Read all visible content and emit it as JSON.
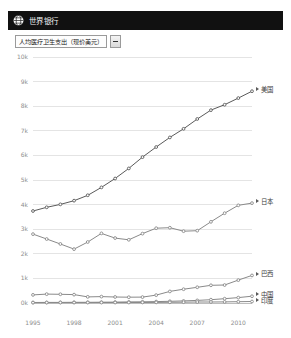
{
  "header": {
    "logo_icon": "globe-icon",
    "title": "世界银行"
  },
  "indicator_select": {
    "value": "人均医疗卫生支出（现价美元）",
    "dropdown_icon": "chevron-down-icon"
  },
  "chart_data": {
    "type": "line",
    "title": "",
    "xlabel": "",
    "ylabel": "",
    "grid": true,
    "legend_position": "right",
    "xlim": [
      1995,
      2011
    ],
    "ylim": [
      0,
      10000
    ],
    "x": [
      1995,
      1996,
      1997,
      1998,
      1999,
      2000,
      2001,
      2002,
      2003,
      2004,
      2005,
      2006,
      2007,
      2008,
      2009,
      2010,
      2011
    ],
    "xtick_labels": [
      "1995",
      "1998",
      "2001",
      "2004",
      "2007",
      "2010"
    ],
    "xtick_values": [
      1995,
      1998,
      2001,
      2004,
      2007,
      2010
    ],
    "ytick_labels": [
      "0k",
      "1k",
      "2k",
      "3k",
      "4k",
      "5k",
      "6k",
      "7k",
      "8k",
      "9k",
      "10k"
    ],
    "ytick_values": [
      0,
      1000,
      2000,
      3000,
      4000,
      5000,
      6000,
      7000,
      8000,
      9000,
      10000
    ],
    "series": [
      {
        "name": "美国",
        "color": "#5a5a5a",
        "values": [
          3740,
          3890,
          4010,
          4160,
          4380,
          4700,
          5060,
          5470,
          5930,
          6340,
          6730,
          7080,
          7480,
          7840,
          8060,
          8330,
          8610
        ]
      },
      {
        "name": "日本",
        "color": "#8a8a8a",
        "values": [
          2800,
          2600,
          2400,
          2190,
          2480,
          2830,
          2640,
          2570,
          2820,
          3040,
          3060,
          2920,
          2940,
          3300,
          3650,
          3970,
          4060
        ]
      },
      {
        "name": "巴西",
        "color": "#8a8a8a",
        "values": [
          330,
          360,
          355,
          340,
          250,
          260,
          245,
          235,
          240,
          320,
          470,
          560,
          640,
          720,
          730,
          930,
          1120
        ]
      },
      {
        "name": "中国",
        "color": "#8a8a8a",
        "values": [
          20,
          23,
          26,
          28,
          30,
          33,
          37,
          44,
          50,
          58,
          70,
          84,
          105,
          135,
          175,
          220,
          275
        ]
      },
      {
        "name": "印度",
        "color": "#8a8a8a",
        "values": [
          15,
          16,
          17,
          17,
          18,
          19,
          19,
          20,
          22,
          25,
          29,
          33,
          40,
          42,
          44,
          52,
          60
        ]
      }
    ]
  },
  "legend": [
    {
      "label": "美国"
    },
    {
      "label": "日本"
    },
    {
      "label": "巴西"
    },
    {
      "label": "中国"
    },
    {
      "label": "印度"
    }
  ]
}
